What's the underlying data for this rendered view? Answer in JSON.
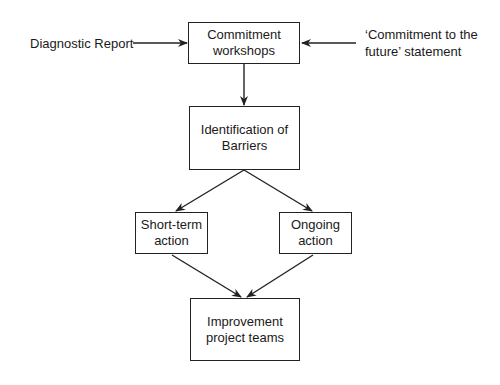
{
  "diagram": {
    "type": "flowchart",
    "inputs": {
      "left": {
        "text": "Diagnostic Report"
      },
      "right": {
        "lines": [
          "‘Commitment to the",
          "future’ statement"
        ]
      }
    },
    "nodes": [
      {
        "id": "commitment",
        "lines": [
          "Commitment",
          "workshops"
        ]
      },
      {
        "id": "barriers",
        "lines": [
          "Identification of",
          "Barriers"
        ]
      },
      {
        "id": "short_term",
        "lines": [
          "Short-term",
          "action"
        ]
      },
      {
        "id": "ongoing",
        "lines": [
          "Ongoing",
          "action"
        ]
      },
      {
        "id": "improvement",
        "lines": [
          "Improvement",
          "project teams"
        ]
      }
    ],
    "edges": [
      {
        "from": "Diagnostic Report",
        "to": "commitment"
      },
      {
        "from": "‘Commitment to the future’ statement",
        "to": "commitment"
      },
      {
        "from": "commitment",
        "to": "barriers"
      },
      {
        "from": "barriers",
        "to": "short_term"
      },
      {
        "from": "barriers",
        "to": "ongoing"
      },
      {
        "from": "short_term",
        "to": "improvement"
      },
      {
        "from": "ongoing",
        "to": "improvement"
      }
    ],
    "colors": {
      "stroke": "#222222",
      "background": "#ffffff",
      "text": "#1a1a1a"
    }
  }
}
